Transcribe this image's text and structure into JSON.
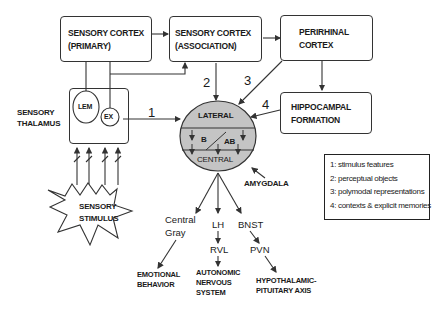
{
  "boxes": {
    "sensory_cortex_primary": {
      "line1": "SENSORY CORTEX",
      "line2": "(PRIMARY)"
    },
    "sensory_cortex_association": {
      "line1": "SENSORY CORTEX",
      "line2": "(ASSOCIATION)"
    },
    "perirhinal_cortex": {
      "line1": "PERIRHINAL",
      "line2": "CORTEX"
    },
    "hippocampal_formation": {
      "line1": "HIPPOCAMPAL",
      "line2": "FORMATION"
    }
  },
  "thalamus": {
    "label_line1": "SENSORY",
    "label_line2": "THALAMUS",
    "nuclei": [
      "LEM",
      "EX"
    ]
  },
  "stimulus": {
    "line1": "SENSORY",
    "line2": "STIMULUS"
  },
  "amygdala": {
    "label": "AMYGDALA",
    "regions": {
      "lateral": "LATERAL",
      "basal": "B",
      "accessory_basal": "AB",
      "central": "CENTRAL"
    }
  },
  "pathway_numbers": [
    "1",
    "2",
    "3",
    "4"
  ],
  "outputs": {
    "central_gray": {
      "line1": "Central",
      "line2": "Gray",
      "target_line1": "EMOTIONAL",
      "target_line2": "BEHAVIOR"
    },
    "lh": {
      "label": "LH",
      "relay": "RVL",
      "target_line1": "AUTONOMIC",
      "target_line2": "NERVOUS",
      "target_line3": "SYSTEM"
    },
    "bnst": {
      "label": "BNST",
      "relay": "PVN",
      "target_line1": "HYPOTHALAMIC-",
      "target_line2": "PITUITARY AXIS"
    }
  },
  "legend": [
    "1: stimulus features",
    "2: perceptual objects",
    "3: polymodal representations",
    "4: contexts & explicit memories"
  ],
  "colors": {
    "amygdala_fill": "#c4c4c4",
    "line": "#333333"
  }
}
